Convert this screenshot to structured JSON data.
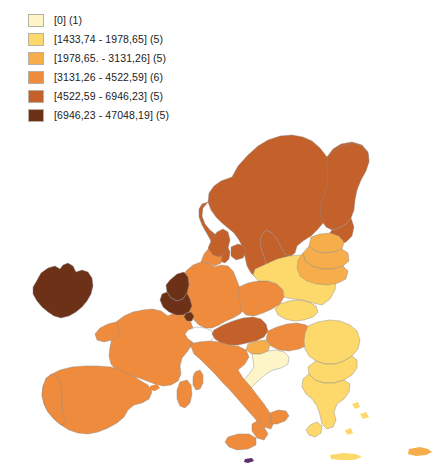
{
  "legend": {
    "items": [
      {
        "label": "[0] (1)",
        "color": "#fdf5c8"
      },
      {
        "label": "[1433,74 - 1978,65] (5)",
        "color": "#fcd96a"
      },
      {
        "label": "[1978,65. - 3131,26] (5)",
        "color": "#f7ae4a"
      },
      {
        "label": "[3131,26 - 4522,59] (6)",
        "color": "#ef8b3c"
      },
      {
        "label": "[4522,59 - 6946,23] (5)",
        "color": "#c4602a"
      },
      {
        "label": "[6946,23 - 47048,19] (5)",
        "color": "#6d3118"
      }
    ]
  },
  "map_data": {
    "type": "choropleth",
    "title": "",
    "projection": "europe",
    "classes": [
      {
        "index": 0,
        "range_label": "[0]",
        "count": 1,
        "color": "#fdf5c8"
      },
      {
        "index": 1,
        "range_label": "[1433,74 - 1978,65]",
        "count": 5,
        "color": "#fcd96a"
      },
      {
        "index": 2,
        "range_label": "[1978,65. - 3131,26]",
        "count": 5,
        "color": "#f7ae4a"
      },
      {
        "index": 3,
        "range_label": "[3131,26 - 4522,59]",
        "count": 6,
        "color": "#ef8b3c"
      },
      {
        "index": 4,
        "range_label": "[4522,59 - 6946,23]",
        "count": 5,
        "color": "#c4602a"
      },
      {
        "index": 5,
        "range_label": "[6946,23 - 47048,19]",
        "count": 5,
        "color": "#6d3118"
      }
    ],
    "regions": [
      {
        "name": "Ireland",
        "class": 5
      },
      {
        "name": "Netherlands",
        "class": 5
      },
      {
        "name": "Belgium",
        "class": 5
      },
      {
        "name": "Luxembourg",
        "class": 5
      },
      {
        "name": "Denmark",
        "class": 4
      },
      {
        "name": "Norway",
        "class": 4
      },
      {
        "name": "Sweden",
        "class": 4
      },
      {
        "name": "Finland",
        "class": 4
      },
      {
        "name": "Austria",
        "class": 4
      },
      {
        "name": "Germany",
        "class": 3
      },
      {
        "name": "France",
        "class": 3
      },
      {
        "name": "Spain",
        "class": 3
      },
      {
        "name": "Portugal",
        "class": 3
      },
      {
        "name": "Italy",
        "class": 3
      },
      {
        "name": "Czechia",
        "class": 3
      },
      {
        "name": "Hungary",
        "class": 3
      },
      {
        "name": "Estonia",
        "class": 2
      },
      {
        "name": "Latvia",
        "class": 2
      },
      {
        "name": "Lithuania",
        "class": 2
      },
      {
        "name": "Slovenia",
        "class": 2
      },
      {
        "name": "Cyprus",
        "class": 2
      },
      {
        "name": "Poland",
        "class": 1
      },
      {
        "name": "Romania",
        "class": 1
      },
      {
        "name": "Bulgaria",
        "class": 1
      },
      {
        "name": "Greece",
        "class": 1
      },
      {
        "name": "Slovakia",
        "class": 1
      },
      {
        "name": "Croatia",
        "class": 0
      },
      {
        "name": "Malta",
        "class": 5
      }
    ]
  }
}
